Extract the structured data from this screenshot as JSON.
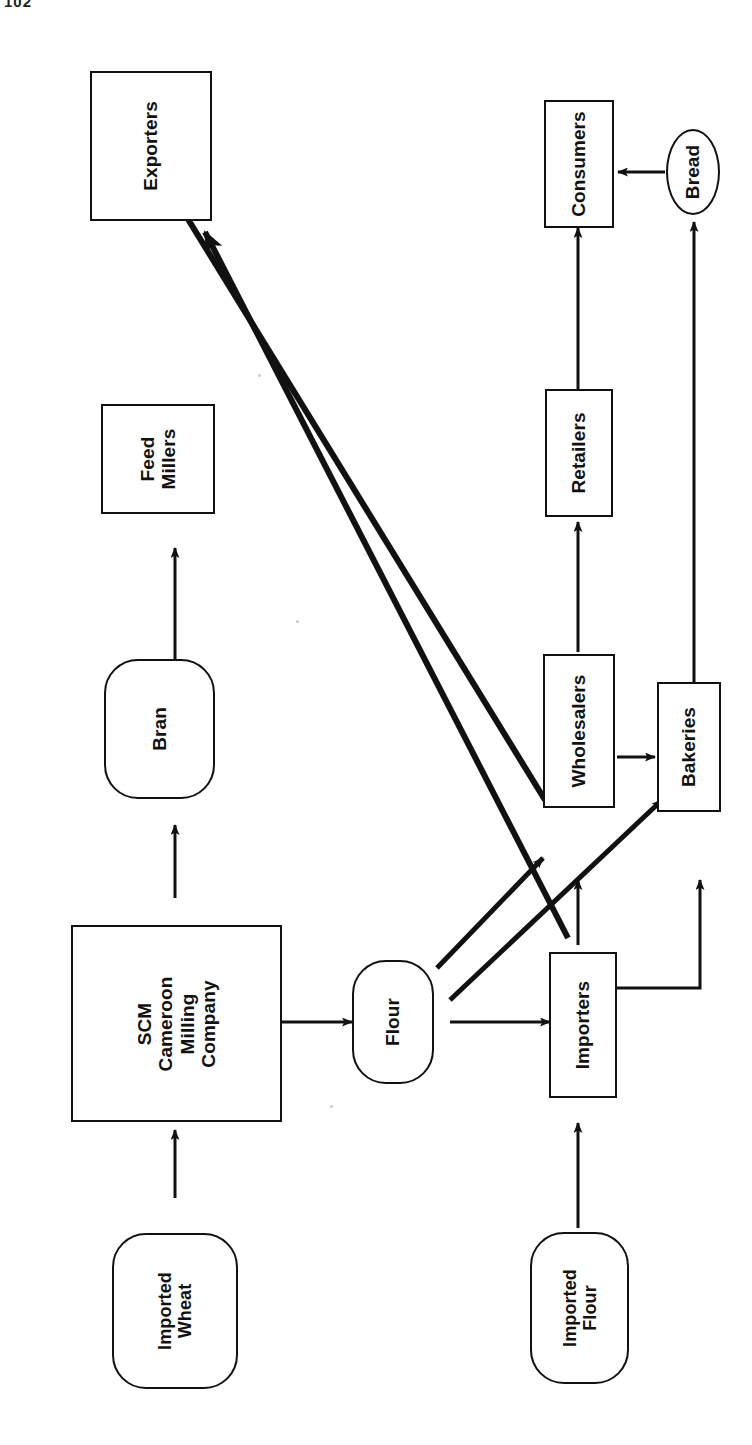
{
  "page": {
    "number": "102"
  },
  "diagram": {
    "orientation": "rotated-90",
    "ink_color": "#111111",
    "background": "#ffffff",
    "nodes": [
      {
        "id": "exporters",
        "label": "Exporters",
        "shape": "rect"
      },
      {
        "id": "consumers",
        "label": "Consumers",
        "shape": "rect"
      },
      {
        "id": "bread",
        "label": "Bread",
        "shape": "ellipse"
      },
      {
        "id": "feed-millers",
        "label": "Feed\nMillers",
        "shape": "rect"
      },
      {
        "id": "retailers",
        "label": "Retailers",
        "shape": "rect"
      },
      {
        "id": "bran",
        "label": "Bran",
        "shape": "round"
      },
      {
        "id": "wholesalers",
        "label": "Wholesalers",
        "shape": "rect"
      },
      {
        "id": "bakeries",
        "label": "Bakeries",
        "shape": "rect"
      },
      {
        "id": "scm",
        "label": "SCM\nCameroon\nMilling\nCompany",
        "shape": "rect"
      },
      {
        "id": "flour",
        "label": "Flour",
        "shape": "round"
      },
      {
        "id": "importers",
        "label": "Importers",
        "shape": "rect"
      },
      {
        "id": "imported-wheat",
        "label": "Imported\nWheat",
        "shape": "round"
      },
      {
        "id": "imported-flour",
        "label": "Imported\nFlour",
        "shape": "round"
      }
    ],
    "edges": [
      {
        "from": "imported-wheat",
        "to": "scm",
        "style": "thin-arrow"
      },
      {
        "from": "scm",
        "to": "bran",
        "style": "thin-arrow"
      },
      {
        "from": "bran",
        "to": "feed-millers",
        "style": "thin-arrow"
      },
      {
        "from": "scm",
        "to": "flour",
        "style": "thin-arrow"
      },
      {
        "from": "flour",
        "to": "importers",
        "style": "thin-arrow"
      },
      {
        "from": "flour",
        "to": "wholesalers",
        "style": "thick-diagonal-arrow"
      },
      {
        "from": "flour",
        "to": "bakeries",
        "style": "thick-diagonal-arrow"
      },
      {
        "from": "imported-flour",
        "to": "importers",
        "style": "thin-arrow"
      },
      {
        "from": "importers",
        "to": "wholesalers",
        "style": "thin-arrow"
      },
      {
        "from": "importers",
        "to": "bakeries",
        "style": "elbow-line"
      },
      {
        "from": "importers",
        "to": "exporters",
        "style": "thick-diagonal-arrow"
      },
      {
        "from": "wholesalers",
        "to": "exporters",
        "style": "thick-diagonal-arrow"
      },
      {
        "from": "wholesalers",
        "to": "bakeries",
        "style": "thin-arrow"
      },
      {
        "from": "wholesalers",
        "to": "retailers",
        "style": "thin-arrow"
      },
      {
        "from": "retailers",
        "to": "consumers",
        "style": "thin-arrow"
      },
      {
        "from": "bakeries",
        "to": "bread",
        "style": "thin-arrow"
      },
      {
        "from": "bread",
        "to": "consumers",
        "style": "thin-arrow"
      }
    ]
  }
}
